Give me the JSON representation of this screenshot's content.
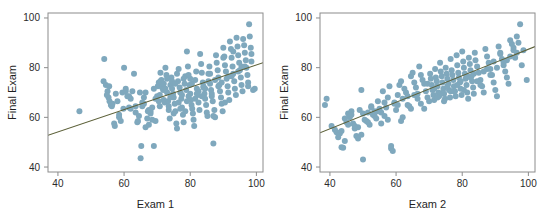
{
  "figure": {
    "background_color": "#ffffff",
    "panel_count": 2
  },
  "chart_data": [
    {
      "type": "scatter",
      "title": "",
      "xlabel": "Exam 1",
      "ylabel": "Final Exam",
      "xlim": [
        37,
        102
      ],
      "ylim": [
        38,
        102
      ],
      "xticks": [
        40,
        60,
        80,
        100
      ],
      "yticks": [
        40,
        60,
        80,
        100
      ],
      "xticklabels": [
        "40",
        "60",
        "80",
        "100"
      ],
      "yticklabels": [
        "40",
        "60",
        "80",
        "100"
      ],
      "grid": false,
      "legend": null,
      "marker_color": "#7fa8bd",
      "marker_size": 3,
      "series": [
        {
          "name": "students",
          "x": [
            46.5,
            54.0,
            54.5,
            55.0,
            55.3,
            55.6,
            56.0,
            56.3,
            57.0,
            57.2,
            58.5,
            59.0,
            59.5,
            60.0,
            60.5,
            61.0,
            61.5,
            62.0,
            62.5,
            63.0,
            63.5,
            64.0,
            64.5,
            65.0,
            65.2,
            65.5,
            66.0,
            66.5,
            67.0,
            67.5,
            68.0,
            68.5,
            69.0,
            69.5,
            70.0,
            70.2,
            70.5,
            70.8,
            71.0,
            71.3,
            71.5,
            71.8,
            72.0,
            72.3,
            72.5,
            72.8,
            73.0,
            73.3,
            73.5,
            73.8,
            74.0,
            74.3,
            74.5,
            74.8,
            75.0,
            75.3,
            75.5,
            75.8,
            76.0,
            76.3,
            76.5,
            76.8,
            77.0,
            77.3,
            77.5,
            77.8,
            78.0,
            78.3,
            78.5,
            78.8,
            79.0,
            79.3,
            79.5,
            79.8,
            80.0,
            80.2,
            80.4,
            80.6,
            80.8,
            81.0,
            81.2,
            81.5,
            81.8,
            82.0,
            82.3,
            82.5,
            82.8,
            83.0,
            83.3,
            83.5,
            83.8,
            84.0,
            84.3,
            84.5,
            84.8,
            85.0,
            85.2,
            85.5,
            85.8,
            86.0,
            86.3,
            86.5,
            86.8,
            87.0,
            87.3,
            87.5,
            87.8,
            88.0,
            88.3,
            88.5,
            88.8,
            89.0,
            89.3,
            89.5,
            89.8,
            90.0,
            90.3,
            90.5,
            90.8,
            91.0,
            91.3,
            91.5,
            91.8,
            92.0,
            92.3,
            92.5,
            92.8,
            93.0,
            93.3,
            93.5,
            93.8,
            94.0,
            94.3,
            94.5,
            94.8,
            95.0,
            95.3,
            95.5,
            95.8,
            96.0,
            96.3,
            96.5,
            96.8,
            97.0,
            97.3,
            97.5,
            97.8,
            98.0,
            98.3,
            98.5,
            64.8,
            65.5,
            69.5,
            71.5,
            87.0,
            80.5,
            78.0,
            76.0,
            74.5,
            73.0,
            68.5,
            66.0,
            62.0,
            60.5,
            58.0,
            57.5,
            56.5,
            55.5,
            54.8,
            53.8,
            72.5,
            75.5,
            79.5,
            82.5,
            85.5,
            88.5,
            91.5,
            94.5,
            97.5,
            99.0,
            70.5,
            73.5,
            77.5,
            81.5,
            84.5,
            86.5,
            89.5,
            92.5,
            95.5,
            98.5,
            67.5,
            69.0,
            71.0,
            74.0,
            76.5,
            78.5,
            80.0,
            83.5,
            86.0,
            90.5,
            61.5,
            63.5,
            66.5,
            68.0,
            72.0,
            75.0,
            77.0,
            79.0,
            82.0,
            84.0,
            87.5,
            90.0,
            93.0,
            96.5,
            99.5,
            58.5,
            59.8,
            64.2,
            67.2,
            70.8
          ],
          "y": [
            62.5,
            83.5,
            73.0,
            70.5,
            68.0,
            66.5,
            65.0,
            64.5,
            57.5,
            56.5,
            60.0,
            58.5,
            70.0,
            80.0,
            71.5,
            68.5,
            64.0,
            63.5,
            70.5,
            77.5,
            62.0,
            58.0,
            60.5,
            43.5,
            48.5,
            64.5,
            68.0,
            56.0,
            59.5,
            57.0,
            61.5,
            59.0,
            48.5,
            58.5,
            68.5,
            72.5,
            74.0,
            69.0,
            78.0,
            75.0,
            73.5,
            71.0,
            67.0,
            66.0,
            80.0,
            77.0,
            70.0,
            66.5,
            63.0,
            59.5,
            73.0,
            76.0,
            71.5,
            69.5,
            68.0,
            65.5,
            62.5,
            57.5,
            55.5,
            74.5,
            79.5,
            72.0,
            70.0,
            67.5,
            64.0,
            61.0,
            58.0,
            73.5,
            76.5,
            71.0,
            86.5,
            80.5,
            77.0,
            73.0,
            69.5,
            67.0,
            65.0,
            63.5,
            61.5,
            59.0,
            56.5,
            75.0,
            78.5,
            71.5,
            69.0,
            66.0,
            63.0,
            85.5,
            81.5,
            78.0,
            74.0,
            72.0,
            69.5,
            67.5,
            65.0,
            62.0,
            60.5,
            77.5,
            80.5,
            73.5,
            71.0,
            68.5,
            66.5,
            49.5,
            63.0,
            60.0,
            85.0,
            82.0,
            79.0,
            76.0,
            73.0,
            70.5,
            68.0,
            65.5,
            62.5,
            88.0,
            84.5,
            81.0,
            78.5,
            75.5,
            72.5,
            70.0,
            67.0,
            90.5,
            87.5,
            84.0,
            80.5,
            77.5,
            74.5,
            71.5,
            69.0,
            92.0,
            88.5,
            85.0,
            82.0,
            79.0,
            76.0,
            73.0,
            70.5,
            91.5,
            89.0,
            86.0,
            83.0,
            80.0,
            77.0,
            74.0,
            97.5,
            92.5,
            88.0,
            85.5,
            70.0,
            66.0,
            67.5,
            72.0,
            60.5,
            73.5,
            75.5,
            77.5,
            74.5,
            75.5,
            64.0,
            65.5,
            67.5,
            70.5,
            66.5,
            69.5,
            65.5,
            72.5,
            69.0,
            74.5,
            71.5,
            73.5,
            68.5,
            70.5,
            74.5,
            72.5,
            76.5,
            78.5,
            72.5,
            71.0,
            66.5,
            64.5,
            69.0,
            67.5,
            71.5,
            69.5,
            74.0,
            76.5,
            80.5,
            82.5,
            63.0,
            71.5,
            74.5,
            68.0,
            66.0,
            62.5,
            75.5,
            68.5,
            77.5,
            66.0,
            68.5,
            64.5,
            70.0,
            62.5,
            73.5,
            61.5,
            63.5,
            66.5,
            69.5,
            72.5,
            75.0,
            84.0,
            86.5,
            80.5,
            71.5,
            61.0,
            63.5,
            58.5,
            62.5,
            64.5
          ]
        }
      ],
      "regression_line": {
        "color": "#5d6139",
        "x0": 37,
        "y0": 52.8,
        "x1": 102,
        "y1": 82.0
      }
    },
    {
      "type": "scatter",
      "title": "",
      "xlabel": "Exam 2",
      "ylabel": "Final Exam",
      "xlim": [
        37,
        102
      ],
      "ylim": [
        38,
        102
      ],
      "xticks": [
        40,
        60,
        80,
        100
      ],
      "yticks": [
        40,
        60,
        80,
        100
      ],
      "xticklabels": [
        "40",
        "60",
        "80",
        "100"
      ],
      "yticklabels": [
        "40",
        "60",
        "80",
        "100"
      ],
      "grid": false,
      "legend": null,
      "marker_color": "#7fa8bd",
      "marker_size": 3,
      "series": [
        {
          "name": "students",
          "x": [
            38.5,
            39.0,
            40.5,
            41.5,
            42.0,
            43.0,
            43.5,
            44.0,
            44.5,
            45.0,
            45.5,
            46.0,
            46.5,
            47.0,
            47.5,
            48.0,
            48.5,
            49.0,
            49.5,
            50.0,
            50.5,
            51.0,
            51.5,
            52.0,
            52.5,
            53.0,
            53.5,
            54.0,
            54.5,
            55.0,
            55.5,
            56.0,
            56.5,
            57.0,
            57.5,
            58.0,
            58.5,
            59.0,
            59.5,
            60.0,
            60.5,
            61.0,
            61.5,
            62.0,
            62.5,
            63.0,
            63.5,
            64.0,
            64.5,
            65.0,
            65.5,
            66.0,
            66.5,
            67.0,
            67.5,
            68.0,
            68.5,
            69.0,
            69.5,
            70.0,
            70.3,
            70.5,
            70.8,
            71.0,
            71.3,
            71.5,
            71.8,
            72.0,
            72.3,
            72.5,
            72.8,
            73.0,
            73.3,
            73.5,
            73.8,
            74.0,
            74.3,
            74.5,
            74.8,
            75.0,
            75.3,
            75.5,
            75.8,
            76.0,
            76.3,
            76.5,
            76.8,
            77.0,
            77.3,
            77.5,
            77.8,
            78.0,
            78.3,
            78.5,
            78.8,
            79.0,
            79.3,
            79.5,
            79.8,
            80.0,
            80.3,
            80.5,
            80.8,
            81.0,
            81.3,
            81.5,
            81.8,
            82.0,
            82.3,
            82.5,
            82.8,
            83.0,
            83.3,
            83.5,
            83.8,
            84.0,
            84.5,
            85.0,
            85.5,
            86.0,
            86.5,
            87.0,
            87.5,
            88.0,
            88.5,
            89.0,
            89.5,
            90.0,
            90.5,
            91.0,
            91.5,
            92.0,
            92.5,
            93.0,
            93.5,
            94.0,
            94.5,
            95.0,
            95.5,
            96.0,
            96.5,
            97.0,
            97.5,
            98.0,
            99.5,
            50.0,
            57.5,
            58.5,
            61.5,
            62.0,
            42.5,
            43.5,
            45.5,
            46.5,
            48.5,
            52.5,
            54.5,
            56.5,
            59.5,
            63.5,
            64.5,
            66.5,
            67.5,
            69.5,
            71.5,
            73.5,
            75.5,
            77.5,
            79.5,
            81.5,
            83.5,
            85.5,
            87.5,
            89.5,
            91.5,
            93.5,
            95.5,
            47.5,
            49.5,
            51.5,
            53.5,
            55.5,
            60.5,
            65.5,
            68.5,
            72.5,
            74.5,
            76.5,
            78.5,
            80.5,
            82.5,
            84.5,
            86.5,
            88.5,
            90.5,
            92.5,
            94.5,
            96.5,
            98.5,
            44.5
          ],
          "y": [
            65.0,
            67.5,
            56.5,
            55.0,
            54.0,
            53.5,
            48.0,
            47.8,
            59.5,
            58.0,
            61.5,
            60.0,
            62.5,
            57.5,
            55.5,
            52.5,
            51.5,
            63.0,
            71.0,
            43.0,
            59.0,
            58.5,
            62.0,
            57.0,
            64.5,
            61.0,
            60.5,
            59.5,
            66.5,
            63.5,
            62.0,
            70.5,
            66.0,
            64.0,
            68.0,
            72.5,
            47.5,
            46.5,
            65.5,
            63.0,
            69.0,
            73.0,
            74.5,
            67.5,
            71.5,
            70.0,
            68.5,
            64.5,
            76.5,
            78.0,
            74.0,
            72.0,
            69.5,
            80.5,
            77.0,
            75.0,
            73.5,
            70.5,
            68.0,
            66.5,
            77.5,
            75.5,
            73.0,
            71.0,
            69.0,
            67.0,
            79.5,
            76.0,
            74.5,
            72.5,
            70.0,
            68.5,
            82.0,
            78.5,
            76.5,
            74.0,
            71.5,
            69.5,
            67.5,
            80.0,
            77.5,
            75.5,
            73.5,
            71.0,
            68.0,
            83.5,
            79.0,
            77.0,
            75.0,
            72.5,
            70.5,
            68.5,
            85.0,
            81.0,
            78.0,
            76.0,
            74.0,
            71.5,
            69.0,
            86.5,
            82.5,
            80.0,
            77.5,
            75.5,
            73.0,
            70.0,
            67.5,
            84.0,
            81.5,
            79.0,
            76.5,
            74.5,
            72.0,
            69.5,
            86.0,
            83.0,
            80.5,
            78.0,
            75.0,
            72.5,
            70.0,
            87.5,
            84.5,
            82.0,
            79.5,
            77.0,
            74.0,
            71.0,
            68.5,
            88.5,
            86.0,
            83.5,
            81.0,
            78.5,
            76.0,
            73.5,
            91.0,
            89.5,
            87.0,
            84.0,
            92.5,
            90.0,
            97.5,
            81.0,
            75.0,
            61.5,
            59.0,
            48.5,
            58.5,
            60.0,
            52.0,
            54.5,
            57.0,
            61.0,
            56.0,
            64.0,
            62.5,
            60.5,
            66.0,
            65.0,
            63.5,
            67.5,
            65.5,
            73.5,
            71.5,
            69.5,
            72.5,
            70.5,
            74.5,
            76.5,
            77.5,
            73.0,
            79.5,
            82.5,
            85.5,
            83.0,
            88.0,
            56.5,
            53.0,
            58.0,
            62.5,
            57.5,
            65.0,
            69.0,
            63.5,
            68.0,
            66.5,
            70.5,
            73.0,
            71.0,
            76.0,
            74.5,
            78.5,
            77.0,
            80.0,
            82.0,
            84.5,
            86.0,
            87.0,
            50.5
          ]
        }
      ],
      "regression_line": {
        "color": "#5d6139",
        "x0": 37,
        "y0": 53.8,
        "x1": 102,
        "y1": 88.5
      }
    }
  ]
}
